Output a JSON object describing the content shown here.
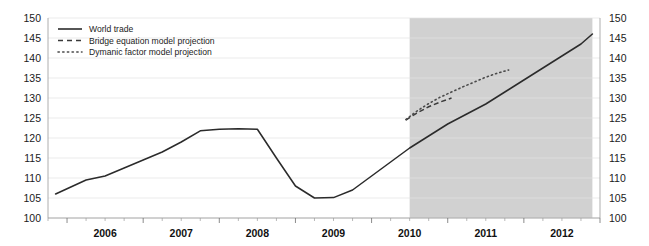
{
  "chart_data": {
    "type": "line",
    "title": "",
    "subtitle": "",
    "xlabel": "",
    "ylabel": "",
    "ylim": [
      100,
      150
    ],
    "xlim": [
      2005.75,
      2013.0
    ],
    "grid": true,
    "legend_position": "top-left",
    "y_ticks": [
      100,
      105,
      110,
      115,
      120,
      125,
      130,
      135,
      140,
      145,
      150
    ],
    "y_tick_labels": [
      "100",
      "105",
      "110",
      "115",
      "120",
      "125",
      "130",
      "135",
      "140",
      "145",
      "150"
    ],
    "y_axis_left_labels": [
      "150",
      "145",
      "140",
      "135",
      "130",
      "125",
      "120",
      "115",
      "110",
      "105",
      "100"
    ],
    "y_axis_right_labels": [
      "150",
      "145",
      "140",
      "135",
      "130",
      "125",
      "120",
      "115",
      "110",
      "105",
      "100"
    ],
    "x_tick_labels": [
      "2006",
      "2007",
      "2008",
      "2009",
      "2010",
      "2011",
      "2012"
    ],
    "x_ticks": [
      2006,
      2007,
      2008,
      2009,
      2010,
      2011,
      2012
    ],
    "x_minor_tick_interval": 0.25,
    "forecast_band": {
      "label": "projection period",
      "start": 2010.5,
      "end": 2012.9,
      "color": "#c9c9c9"
    },
    "series": [
      {
        "name": "World trade",
        "style": "solid",
        "color": "#2b2b2b",
        "x": [
          2005.85,
          2006.0,
          2006.25,
          2006.5,
          2006.75,
          2007.0,
          2007.25,
          2007.5,
          2007.75,
          2008.0,
          2008.25,
          2008.5,
          2008.75,
          2009.0,
          2009.25,
          2009.5,
          2009.75,
          2010.0,
          2010.25,
          2010.5,
          2010.75,
          2011.0,
          2011.25,
          2011.5,
          2011.75,
          2012.0,
          2012.25,
          2012.5,
          2012.75,
          2012.9
        ],
        "values": [
          106.0,
          107.3,
          109.5,
          110.5,
          112.5,
          114.5,
          116.5,
          119.0,
          121.8,
          122.2,
          122.3,
          122.2,
          115.0,
          108.0,
          105.0,
          105.1,
          107.0,
          110.5,
          114.0,
          117.5,
          120.5,
          123.5,
          126.0,
          128.5,
          131.5,
          134.5,
          137.5,
          140.5,
          143.5,
          146.0
        ]
      },
      {
        "name": "Bridge equation model projection",
        "style": "dashed",
        "color": "#3a3a3a",
        "x": [
          2010.45,
          2010.6,
          2010.75,
          2010.9,
          2011.05
        ],
        "values": [
          124.5,
          126.3,
          127.8,
          129.0,
          130.0
        ]
      },
      {
        "name": "Dymanic factor model projection",
        "style": "dotted",
        "color": "#4a4a4a",
        "x": [
          2010.45,
          2010.6,
          2010.75,
          2010.9,
          2011.05,
          2011.2,
          2011.35,
          2011.5,
          2011.65,
          2011.8
        ],
        "values": [
          124.6,
          126.8,
          128.6,
          130.2,
          131.5,
          132.8,
          134.0,
          135.2,
          136.2,
          137.0
        ]
      }
    ]
  },
  "legend": {
    "items": [
      {
        "label": "World trade",
        "style": "solid"
      },
      {
        "label": "Bridge equation model projection",
        "style": "dashed"
      },
      {
        "label": "Dymanic factor model projection",
        "style": "dotted"
      }
    ]
  }
}
